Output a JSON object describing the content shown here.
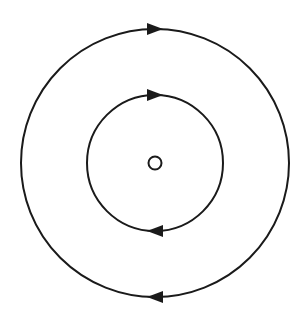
{
  "diagram": {
    "title": "",
    "center": {
      "x": 155,
      "y": 163
    },
    "colors": {
      "stroke": "#1a1a1a",
      "background": "#ffffff"
    },
    "core": {
      "label": "",
      "radius": 7
    },
    "rings": [
      {
        "name": "outer-ring",
        "radius": 134,
        "arrows": [
          {
            "position": "top",
            "direction": "right"
          },
          {
            "position": "bottom",
            "direction": "left"
          }
        ]
      },
      {
        "name": "inner-ring",
        "radius": 68,
        "arrows": [
          {
            "position": "top",
            "direction": "right"
          },
          {
            "position": "bottom",
            "direction": "left"
          }
        ]
      }
    ],
    "flow": "clockwise"
  }
}
